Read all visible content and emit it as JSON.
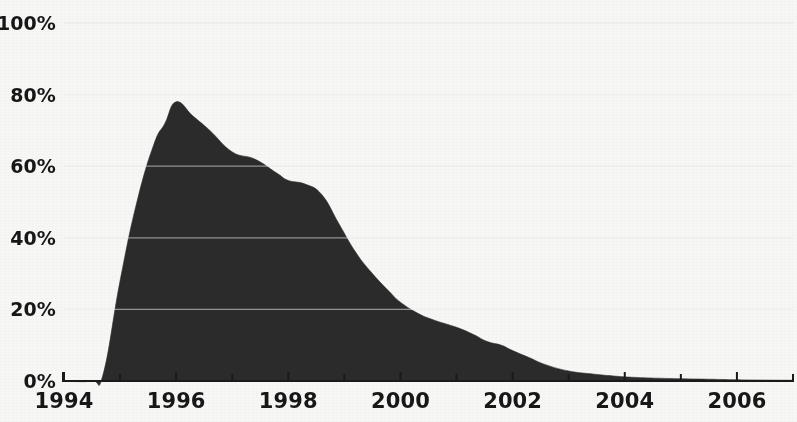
{
  "chart_data": {
    "type": "area",
    "title": "",
    "subtitle": "",
    "xlabel": "",
    "ylabel": "",
    "xlim": [
      1994,
      2007
    ],
    "ylim": [
      0,
      100
    ],
    "grid": true,
    "legend": null,
    "series_name": "Share",
    "fill_color": "#2b2b2b",
    "background_color": "#f7f7f6",
    "gridline_color": "#ffffff",
    "axis_color": "#1a1a1a",
    "y_ticks": [
      {
        "value": 0,
        "label": "0%"
      },
      {
        "value": 20,
        "label": "20%"
      },
      {
        "value": 40,
        "label": "40%"
      },
      {
        "value": 60,
        "label": "60%"
      },
      {
        "value": 80,
        "label": "80%"
      },
      {
        "value": 100,
        "label": "100%"
      }
    ],
    "x_ticks": [
      {
        "value": 1994,
        "label": "1994"
      },
      {
        "value": 1995,
        "label": ""
      },
      {
        "value": 1996,
        "label": "1996"
      },
      {
        "value": 1997,
        "label": ""
      },
      {
        "value": 1998,
        "label": "1998"
      },
      {
        "value": 1999,
        "label": ""
      },
      {
        "value": 2000,
        "label": "2000"
      },
      {
        "value": 2001,
        "label": ""
      },
      {
        "value": 2002,
        "label": "2002"
      },
      {
        "value": 2003,
        "label": ""
      },
      {
        "value": 2004,
        "label": "2004"
      },
      {
        "value": 2005,
        "label": ""
      },
      {
        "value": 2006,
        "label": "2006"
      },
      {
        "value": 2007,
        "label": ""
      }
    ],
    "x": [
      1994.0,
      1994.5,
      1994.7,
      1995.0,
      1995.3,
      1995.6,
      1995.8,
      1996.0,
      1996.3,
      1996.6,
      1997.0,
      1997.4,
      1997.8,
      1998.0,
      1998.3,
      1998.6,
      1998.9,
      1999.2,
      1999.5,
      1999.8,
      2000.0,
      2000.3,
      2000.6,
      2001.0,
      2001.3,
      2001.55,
      2001.8,
      2002.0,
      2002.3,
      2002.6,
      2003.0,
      2003.4,
      2003.8,
      2004.2,
      2004.8,
      2005.5,
      2006.2,
      2007.0
    ],
    "values": [
      0,
      0,
      2,
      28,
      50,
      66,
      72,
      78,
      74,
      70,
      64,
      62,
      58,
      56,
      55,
      52,
      44,
      36,
      30,
      25,
      22,
      19,
      17,
      15,
      13,
      11,
      10,
      8.5,
      6.5,
      4.5,
      2.8,
      2.0,
      1.4,
      1.0,
      0.7,
      0.5,
      0.3,
      0.2
    ],
    "annotations": []
  }
}
